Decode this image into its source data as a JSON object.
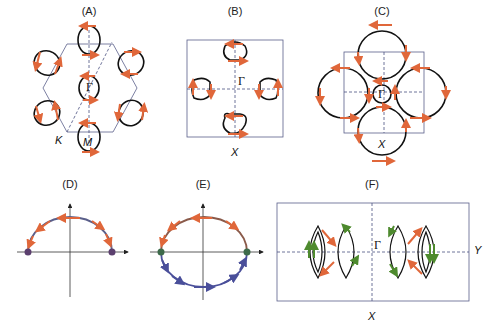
{
  "figure": {
    "panels": [
      {
        "id": "A",
        "label": "(A)",
        "symbols": [
          "Γ",
          "K",
          "M"
        ],
        "lattice": "hexagonal"
      },
      {
        "id": "B",
        "label": "(B)",
        "symbols": [
          "Γ",
          "X"
        ],
        "lattice": "square"
      },
      {
        "id": "C",
        "label": "(C)",
        "symbols": [
          "Γ",
          "X"
        ],
        "lattice": "square"
      },
      {
        "id": "D",
        "label": "(D)",
        "symbols": [],
        "lattice": "axes"
      },
      {
        "id": "E",
        "label": "(E)",
        "symbols": [],
        "lattice": "axes"
      },
      {
        "id": "F",
        "label": "(F)",
        "symbols": [
          "Γ",
          "X",
          "Y"
        ],
        "lattice": "rectangular"
      }
    ],
    "colors": {
      "arrow_orange": "#e0673a",
      "arrow_green": "#4e8a2e",
      "arrow_blue": "#4a4f9a",
      "contour": "#111111",
      "zone_boundary": "#5a5f8a",
      "node_point": "#5b3f6e"
    }
  },
  "labels": {
    "A": "(A)",
    "B": "(B)",
    "C": "(C)",
    "D": "(D)",
    "E": "(E)",
    "F": "(F)",
    "gamma": "Γ",
    "K": "K",
    "M": "M",
    "X": "X",
    "Y": "Y"
  }
}
